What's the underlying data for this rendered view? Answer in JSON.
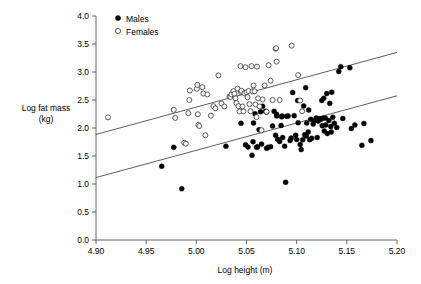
{
  "chart_data": {
    "type": "scatter",
    "title": "",
    "xlabel": "Log height (m)",
    "ylabel": "Log fat mass\n(kg)",
    "ylabel_line1": "Log fat mass",
    "ylabel_line2": "(kg)",
    "xlim": [
      4.9,
      5.2
    ],
    "ylim": [
      0.0,
      4.0
    ],
    "xticks": [
      4.9,
      4.95,
      5.0,
      5.05,
      5.1,
      5.15,
      5.2
    ],
    "xtick_labels": [
      "4.90",
      "4.95",
      "5.00",
      "5.05",
      "5.10",
      "5.15",
      "5.20"
    ],
    "yticks": [
      0.0,
      0.5,
      1.0,
      1.5,
      2.0,
      2.5,
      3.0,
      3.5,
      4.0
    ],
    "ytick_labels": [
      "0.0",
      "0.5",
      "1.0",
      "1.5",
      "2.0",
      "2.5",
      "3.0",
      "3.5",
      "4.0"
    ],
    "grid": false,
    "legend_position": "top-left",
    "legend": [
      {
        "label": "Males",
        "marker": "filled-circle",
        "color": "#000000"
      },
      {
        "label": "Females",
        "marker": "open-circle",
        "color": "#000000"
      }
    ],
    "series": [
      {
        "name": "Males",
        "marker": "filled-circle",
        "color": "#000000",
        "points": [
          [
            4.9655,
            1.315
          ],
          [
            4.9775,
            1.655
          ],
          [
            4.9855,
            0.915
          ],
          [
            5.0295,
            1.675
          ],
          [
            5.0445,
            2.085
          ],
          [
            5.049,
            1.7
          ],
          [
            5.0515,
            1.66
          ],
          [
            5.0555,
            1.515
          ],
          [
            5.0565,
            1.755
          ],
          [
            5.057,
            2.09
          ],
          [
            5.0585,
            2.255
          ],
          [
            5.06,
            1.655
          ],
          [
            5.061,
            1.665
          ],
          [
            5.0625,
            1.97
          ],
          [
            5.064,
            2.29
          ],
          [
            5.065,
            1.715
          ],
          [
            5.066,
            2.39
          ],
          [
            5.069,
            2.3
          ],
          [
            5.07,
            2.285
          ],
          [
            5.07,
            1.64
          ],
          [
            5.0715,
            1.655
          ],
          [
            5.074,
            1.665
          ],
          [
            5.076,
            2.035
          ],
          [
            5.0775,
            2.3
          ],
          [
            5.079,
            1.87
          ],
          [
            5.08,
            2.245
          ],
          [
            5.08,
            2.215
          ],
          [
            5.081,
            1.8
          ],
          [
            5.083,
            1.76
          ],
          [
            5.0845,
            2.045
          ],
          [
            5.085,
            2.2
          ],
          [
            5.0855,
            2.215
          ],
          [
            5.086,
            1.83
          ],
          [
            5.088,
            1.675
          ],
          [
            5.089,
            1.03
          ],
          [
            5.09,
            2.21
          ],
          [
            5.0915,
            2.215
          ],
          [
            5.0935,
            1.775
          ],
          [
            5.0945,
            1.82
          ],
          [
            5.096,
            2.635
          ],
          [
            5.0975,
            2.22
          ],
          [
            5.099,
            1.87
          ],
          [
            5.1,
            1.795
          ],
          [
            5.101,
            2.49
          ],
          [
            5.1015,
            2.095
          ],
          [
            5.1035,
            1.705
          ],
          [
            5.1045,
            1.615
          ],
          [
            5.106,
            1.79
          ],
          [
            5.107,
            2.395
          ],
          [
            5.108,
            1.88
          ],
          [
            5.109,
            2.72
          ],
          [
            5.1095,
            1.855
          ],
          [
            5.11,
            2.09
          ],
          [
            5.1115,
            1.93
          ],
          [
            5.112,
            2.32
          ],
          [
            5.113,
            1.79
          ],
          [
            5.114,
            2.155
          ],
          [
            5.115,
            1.815
          ],
          [
            5.1165,
            2.07
          ],
          [
            5.118,
            2.135
          ],
          [
            5.1195,
            2.18
          ],
          [
            5.1205,
            1.83
          ],
          [
            5.1215,
            2.125
          ],
          [
            5.123,
            2.165
          ],
          [
            5.124,
            2.155
          ],
          [
            5.125,
            2.49
          ],
          [
            5.1255,
            2.04
          ],
          [
            5.126,
            2.175
          ],
          [
            5.127,
            2.53
          ],
          [
            5.1275,
            1.945
          ],
          [
            5.1285,
            2.18
          ],
          [
            5.129,
            2.055
          ],
          [
            5.13,
            2.615
          ],
          [
            5.1305,
            1.9
          ],
          [
            5.132,
            2.135
          ],
          [
            5.133,
            2.44
          ],
          [
            5.134,
            2.025
          ],
          [
            5.1345,
            1.93
          ],
          [
            5.135,
            2.64
          ],
          [
            5.136,
            2.19
          ],
          [
            5.1375,
            2.085
          ],
          [
            5.14,
            2.01
          ],
          [
            5.142,
            3.01
          ],
          [
            5.144,
            3.095
          ],
          [
            5.146,
            2.17
          ],
          [
            5.153,
            3.075
          ],
          [
            5.1545,
            1.99
          ],
          [
            5.158,
            2.055
          ],
          [
            5.165,
            1.69
          ],
          [
            5.167,
            2.08
          ],
          [
            5.174,
            1.775
          ]
        ]
      },
      {
        "name": "Females",
        "marker": "open-circle",
        "color": "#000000",
        "points": [
          [
            4.912,
            2.19
          ],
          [
            4.9775,
            2.325
          ],
          [
            4.979,
            2.18
          ],
          [
            4.988,
            1.735
          ],
          [
            4.9895,
            1.72
          ],
          [
            4.992,
            2.265
          ],
          [
            4.993,
            2.5
          ],
          [
            4.9935,
            2.67
          ],
          [
            5.0005,
            2.7
          ],
          [
            5.001,
            2.77
          ],
          [
            5.0015,
            2.245
          ],
          [
            5.002,
            2.055
          ],
          [
            5.003,
            2.035
          ],
          [
            5.006,
            2.73
          ],
          [
            5.007,
            2.615
          ],
          [
            5.009,
            1.87
          ],
          [
            5.011,
            2.6
          ],
          [
            5.0145,
            2.22
          ],
          [
            5.017,
            2.39
          ],
          [
            5.019,
            2.35
          ],
          [
            5.022,
            2.94
          ],
          [
            5.025,
            2.44
          ],
          [
            5.028,
            2.385
          ],
          [
            5.033,
            2.56
          ],
          [
            5.034,
            2.555
          ],
          [
            5.035,
            2.6
          ],
          [
            5.037,
            2.66
          ],
          [
            5.038,
            2.61
          ],
          [
            5.039,
            2.53
          ],
          [
            5.04,
            2.445
          ],
          [
            5.041,
            2.705
          ],
          [
            5.042,
            2.39
          ],
          [
            5.043,
            2.295
          ],
          [
            5.044,
            3.105
          ],
          [
            5.0445,
            2.64
          ],
          [
            5.045,
            2.665
          ],
          [
            5.046,
            2.385
          ],
          [
            5.047,
            2.295
          ],
          [
            5.048,
            2.62
          ],
          [
            5.049,
            3.085
          ],
          [
            5.05,
            2.64
          ],
          [
            5.051,
            2.55
          ],
          [
            5.052,
            2.66
          ],
          [
            5.053,
            2.425
          ],
          [
            5.054,
            2.3
          ],
          [
            5.055,
            3.105
          ],
          [
            5.056,
            2.655
          ],
          [
            5.057,
            2.76
          ],
          [
            5.058,
            2.655
          ],
          [
            5.059,
            2.42
          ],
          [
            5.06,
            2.195
          ],
          [
            5.0605,
            3.095
          ],
          [
            5.0615,
            2.53
          ],
          [
            5.063,
            2.385
          ],
          [
            5.065,
            1.96
          ],
          [
            5.066,
            2.51
          ],
          [
            5.068,
            2.76
          ],
          [
            5.07,
            2.29
          ],
          [
            5.072,
            3.12
          ],
          [
            5.074,
            2.845
          ],
          [
            5.076,
            2.5
          ],
          [
            5.079,
            3.415
          ],
          [
            5.0795,
            3.425
          ],
          [
            5.08,
            3.185
          ],
          [
            5.083,
            2.5
          ],
          [
            5.095,
            3.47
          ],
          [
            5.1015,
            2.945
          ],
          [
            5.1035,
            2.49
          ],
          [
            5.1055,
            2.3
          ]
        ]
      }
    ],
    "fit_lines": [
      {
        "name": "Females fit",
        "x_start": 4.9,
        "y_start": 1.885,
        "x_end": 5.2,
        "y_end": 3.35
      },
      {
        "name": "Males fit",
        "x_start": 4.9,
        "y_start": 1.115,
        "x_end": 5.2,
        "y_end": 2.575
      }
    ]
  }
}
